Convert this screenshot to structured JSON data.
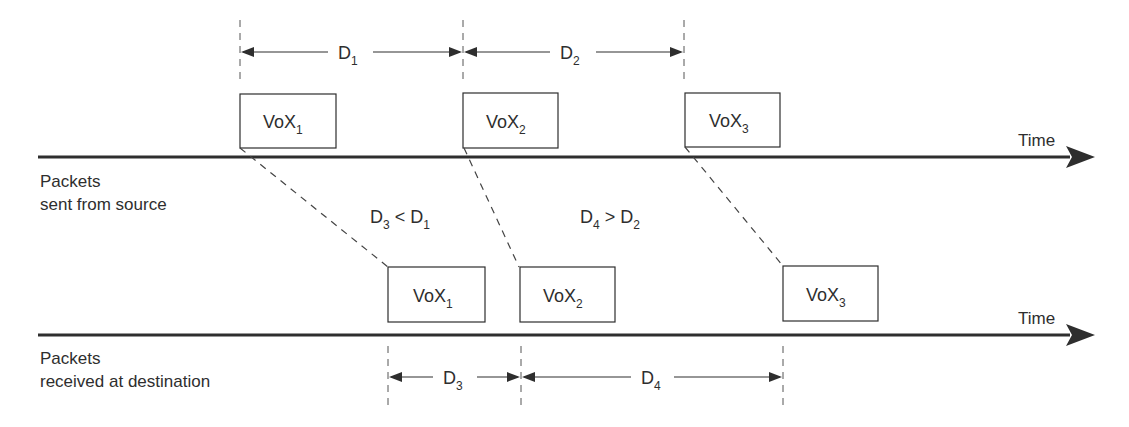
{
  "diagram": {
    "colors": {
      "line": "#2e2e2e",
      "text": "#2e2e2e",
      "background": "#ffffff"
    },
    "source_axis": {
      "label_line1": "Packets",
      "label_line2": "sent from source",
      "time_label": "Time"
    },
    "destination_axis": {
      "label_line1": "Packets",
      "label_line2": "received at destination",
      "time_label": "Time"
    },
    "source_packets": [
      {
        "base": "VoX",
        "sub": "1"
      },
      {
        "base": "VoX",
        "sub": "2"
      },
      {
        "base": "VoX",
        "sub": "3"
      }
    ],
    "destination_packets": [
      {
        "base": "VoX",
        "sub": "1"
      },
      {
        "base": "VoX",
        "sub": "2"
      },
      {
        "base": "VoX",
        "sub": "3"
      }
    ],
    "source_intervals": [
      {
        "base": "D",
        "sub": "1"
      },
      {
        "base": "D",
        "sub": "2"
      }
    ],
    "destination_intervals": [
      {
        "base": "D",
        "sub": "3"
      },
      {
        "base": "D",
        "sub": "4"
      }
    ],
    "comparisons": [
      {
        "left": "D",
        "left_sub": "3",
        "op": " < ",
        "right": "D",
        "right_sub": "1"
      },
      {
        "left": "D",
        "left_sub": "4",
        "op": " > ",
        "right": "D",
        "right_sub": "2"
      }
    ]
  }
}
